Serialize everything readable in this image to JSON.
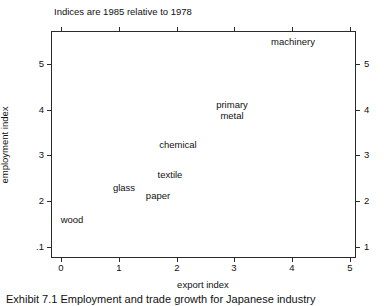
{
  "chart_data": {
    "type": "scatter",
    "title": "Indices are 1985 relative to 1978",
    "xlabel": "export index",
    "ylabel": "employment index",
    "xlim": [
      -0.17,
      5.1
    ],
    "ylim": [
      0.75,
      5.72
    ],
    "grid": false,
    "legend": "none",
    "xticks": [
      {
        "value": 0,
        "label": "0"
      },
      {
        "value": 1,
        "label": "1"
      },
      {
        "value": 2,
        "label": "2"
      },
      {
        "value": 3,
        "label": "3"
      },
      {
        "value": 4,
        "label": "4"
      },
      {
        "value": 5,
        "label": "5"
      }
    ],
    "yticks_left": [
      {
        "value": 5,
        "label": "5"
      },
      {
        "value": 4,
        "label": "4"
      },
      {
        "value": 3,
        "label": "3"
      },
      {
        "value": 2,
        "label": "2"
      },
      {
        "value": 1,
        "label": ".1"
      }
    ],
    "yticks_right": [
      {
        "value": 5,
        "label": "5"
      },
      {
        "value": 4,
        "label": "4"
      },
      {
        "value": 3,
        "label": "3"
      },
      {
        "value": 2,
        "label": "2"
      },
      {
        "value": 1,
        "label": "1"
      }
    ],
    "points": [
      {
        "label": "machinery",
        "x": 4.0,
        "y": 5.4,
        "px": 293,
        "py": 42
      },
      {
        "label": "primary\nmetal",
        "x": 3.0,
        "y": 3.9,
        "px": 232,
        "py": 110
      },
      {
        "label": "chemical",
        "x": 2.05,
        "y": 3.0,
        "px": 178,
        "py": 145
      },
      {
        "label": "textile",
        "x": 1.9,
        "y": 2.35,
        "px": 170,
        "py": 175
      },
      {
        "label": "glass",
        "x": 1.1,
        "y": 2.0,
        "px": 124,
        "py": 188
      },
      {
        "label": "paper",
        "x": 1.7,
        "y": 1.85,
        "px": 158,
        "py": 196
      },
      {
        "label": "wood",
        "x": 0.2,
        "y": 1.3,
        "px": 72,
        "py": 220
      }
    ]
  },
  "caption": {
    "text": "Exhibit 7.1  Employment and trade growth for Japanese industry"
  },
  "colors": {
    "axis": "#2b2b2b",
    "text": "#111111",
    "background": "#ffffff"
  }
}
